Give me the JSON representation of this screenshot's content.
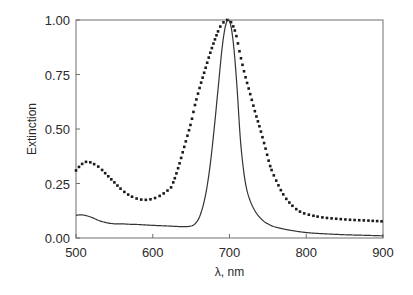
{
  "chart_data": {
    "type": "line",
    "title": "",
    "xlabel": "λ, nm",
    "ylabel": "Extinction",
    "xlim": [
      500,
      900
    ],
    "ylim": [
      0.0,
      1.0
    ],
    "x_ticks": [
      500,
      600,
      700,
      800,
      900
    ],
    "x_tick_labels": [
      "500",
      "600",
      "700",
      "800",
      "900"
    ],
    "y_ticks": [
      0.0,
      0.25,
      0.5,
      0.75,
      1.0
    ],
    "y_tick_labels": [
      "0.00",
      "0.25",
      "0.50",
      "0.75",
      "1.00"
    ],
    "grid": false,
    "legend": null,
    "series": [
      {
        "name": "dotted (broad spectrum)",
        "style": "dotted",
        "color": "#1a1a1a",
        "x": [
          500,
          505,
          510,
          515,
          520,
          530,
          540,
          550,
          560,
          570,
          580,
          590,
          600,
          610,
          620,
          625,
          633,
          642,
          650,
          655,
          662,
          668,
          675,
          682,
          688,
          694,
          698,
          702,
          708,
          714,
          720,
          727,
          734,
          740,
          747,
          753,
          760,
          770,
          780,
          790,
          800,
          820,
          840,
          860,
          880,
          900
        ],
        "y": [
          0.31,
          0.33,
          0.345,
          0.35,
          0.345,
          0.325,
          0.29,
          0.255,
          0.22,
          0.195,
          0.18,
          0.175,
          0.18,
          0.195,
          0.22,
          0.24,
          0.32,
          0.43,
          0.53,
          0.61,
          0.7,
          0.77,
          0.85,
          0.92,
          0.97,
          0.995,
          1.0,
          0.99,
          0.94,
          0.84,
          0.75,
          0.66,
          0.57,
          0.5,
          0.41,
          0.33,
          0.27,
          0.2,
          0.155,
          0.125,
          0.11,
          0.095,
          0.088,
          0.083,
          0.08,
          0.076
        ]
      },
      {
        "name": "solid (narrow spectrum)",
        "style": "solid",
        "color": "#333333",
        "x": [
          500,
          510,
          520,
          530,
          540,
          550,
          560,
          570,
          580,
          590,
          600,
          620,
          640,
          650,
          655,
          660,
          665,
          670,
          675,
          680,
          685,
          690,
          694,
          698,
          702,
          706,
          710,
          714,
          718,
          722,
          727,
          734,
          742,
          750,
          760,
          780,
          800,
          820,
          850,
          880,
          900
        ],
        "y": [
          0.105,
          0.105,
          0.095,
          0.08,
          0.07,
          0.065,
          0.065,
          0.063,
          0.062,
          0.06,
          0.058,
          0.055,
          0.052,
          0.055,
          0.065,
          0.09,
          0.14,
          0.22,
          0.34,
          0.5,
          0.68,
          0.86,
          0.96,
          1.0,
          0.97,
          0.86,
          0.68,
          0.46,
          0.32,
          0.23,
          0.17,
          0.12,
          0.085,
          0.065,
          0.05,
          0.035,
          0.025,
          0.02,
          0.015,
          0.012,
          0.01
        ]
      }
    ]
  }
}
